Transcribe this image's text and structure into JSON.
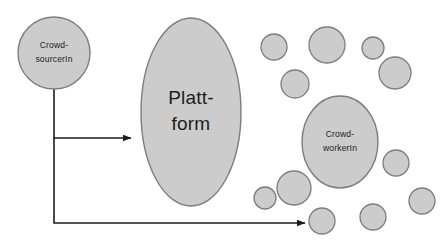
{
  "diagram": {
    "background_color": "#ffffff",
    "shape_fill": "#cccccc",
    "shape_stroke": "#7d7d7d",
    "text_color": "#1d1d1b",
    "arrow_color": "#1d1d1b",
    "nodes": [
      {
        "id": "crowdsourcer",
        "name": "crowdsourcer-node",
        "shape": "circle",
        "cx": 54,
        "cy": 53,
        "rx": 36,
        "ry": 36,
        "label_lines": [
          "Crowd-",
          "sourcerIn"
        ],
        "label_size": "small"
      },
      {
        "id": "plattform",
        "name": "plattform-node",
        "shape": "ellipse",
        "cx": 191,
        "cy": 112,
        "rx": 50,
        "ry": 94,
        "label_lines": [
          "Platt-",
          "form"
        ],
        "label_size": "large"
      },
      {
        "id": "crowdworker",
        "name": "crowdworker-node",
        "shape": "ellipse",
        "cx": 340,
        "cy": 142,
        "rx": 38,
        "ry": 46,
        "label_lines": [
          "Crowd-",
          "workerIn"
        ],
        "label_size": "small"
      }
    ],
    "crowd_circles": [
      {
        "cx": 274,
        "cy": 47,
        "r": 13
      },
      {
        "cx": 327,
        "cy": 45,
        "r": 18
      },
      {
        "cx": 373,
        "cy": 48,
        "r": 11
      },
      {
        "cx": 395,
        "cy": 73,
        "r": 16
      },
      {
        "cx": 295,
        "cy": 84,
        "r": 14
      },
      {
        "cx": 396,
        "cy": 163,
        "r": 13
      },
      {
        "cx": 422,
        "cy": 201,
        "r": 13
      },
      {
        "cx": 373,
        "cy": 217,
        "r": 13
      },
      {
        "cx": 294,
        "cy": 188,
        "r": 17
      },
      {
        "cx": 265,
        "cy": 198,
        "r": 11
      },
      {
        "cx": 322,
        "cy": 221,
        "r": 13
      }
    ],
    "connectors": [
      {
        "id": "crowdsourcer-to-plattform",
        "name": "arrow-crowdsourcer-to-plattform",
        "path": "M 54 89 L 54 138 L 131 138",
        "has_arrowhead": true
      },
      {
        "id": "crowdsourcer-to-crowd",
        "name": "arrow-crowdsourcer-to-crowd",
        "path": "M 54 138 L 54 223 L 305 223",
        "has_arrowhead": true
      }
    ]
  }
}
